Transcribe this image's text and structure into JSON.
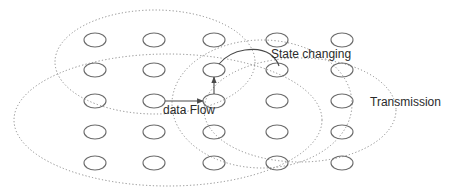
{
  "diagram": {
    "labels": {
      "data_flow": "data Flow",
      "state_changing": "State changing",
      "transmission": "Transmission"
    },
    "node_grid": {
      "columns_x": [
        95,
        154,
        214,
        277,
        342
      ],
      "rows_y": [
        40,
        70,
        101,
        132,
        163
      ],
      "node_rx": 11,
      "node_ry": 7
    },
    "ranges": [
      {
        "name": "range-top-left",
        "cx": 155,
        "cy": 62,
        "rx": 100,
        "ry": 52
      },
      {
        "name": "range-bottom-left",
        "cx": 168,
        "cy": 120,
        "rx": 154,
        "ry": 66
      },
      {
        "name": "range-center",
        "cx": 262,
        "cy": 104,
        "rx": 90,
        "ry": 64
      },
      {
        "name": "range-right",
        "cx": 300,
        "cy": 110,
        "rx": 96,
        "ry": 52
      }
    ],
    "flows": [
      {
        "name": "data-flow-arrow",
        "from": [
          165,
          101
        ],
        "to": [
          203,
          101
        ]
      },
      {
        "name": "state-up-arrow",
        "from": [
          214,
          94
        ],
        "to": [
          214,
          77
        ]
      },
      {
        "name": "state-change-arrow",
        "from": [
          220,
          64
        ],
        "to": [
          272,
          66
        ]
      }
    ],
    "colors": {
      "node_stroke": "#6b6b6b",
      "range_stroke": "#8a8a8a",
      "flow_stroke": "#4a4a4a",
      "text": "#2b2b2b"
    }
  }
}
